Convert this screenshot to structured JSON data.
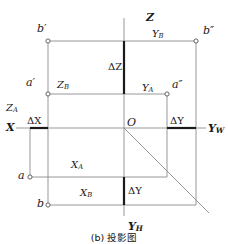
{
  "figure": {
    "caption": "(b) 投影图",
    "background_color": "#ffffff",
    "line_color": "#8c8c8c",
    "bold_line_color": "#1a1a1a",
    "text_color": "#1a1a1a"
  },
  "axes": [
    {
      "name": "z-axis",
      "label": "Z",
      "sub": "",
      "x": 146,
      "y": 12
    },
    {
      "name": "x-axis",
      "label": "X",
      "sub": "",
      "x": 6,
      "y": 122
    },
    {
      "name": "yw-axis",
      "label": "Y",
      "sub": "W",
      "x": 208,
      "y": 123
    },
    {
      "name": "yh-axis",
      "label": "Y",
      "sub": "H",
      "x": 128,
      "y": 221
    }
  ],
  "points": [
    {
      "name": "point-b-prime",
      "label": "b′",
      "lx": 37,
      "ly": 23,
      "cx": 48,
      "cy": 41
    },
    {
      "name": "point-b-double-prime",
      "label": "b″",
      "lx": 203,
      "ly": 25,
      "cx": 196,
      "cy": 41
    },
    {
      "name": "point-a-prime",
      "label": "a′",
      "lx": 26,
      "ly": 77,
      "cx": 48,
      "cy": 94
    },
    {
      "name": "point-a-double-prime",
      "label": "a″",
      "lx": 172,
      "ly": 79,
      "cx": 167,
      "cy": 94
    },
    {
      "name": "point-origin",
      "label": "O",
      "lx": 127,
      "ly": 117,
      "cx": 124,
      "cy": 128
    },
    {
      "name": "point-a",
      "label": "a",
      "lx": 18,
      "ly": 170,
      "cx": 30,
      "cy": 177
    },
    {
      "name": "point-b",
      "label": "b",
      "lx": 37,
      "ly": 198,
      "cx": 48,
      "cy": 205
    }
  ],
  "dimension_labels": [
    {
      "name": "label-yb",
      "text": "Y",
      "sub": "B",
      "x": 152,
      "y": 29,
      "size": 10
    },
    {
      "name": "label-zb",
      "text": "Z",
      "sub": "B",
      "x": 57,
      "y": 80,
      "size": 10
    },
    {
      "name": "label-delta-z",
      "text": "ΔZ",
      "sub": "",
      "x": 108,
      "y": 62,
      "size": 10
    },
    {
      "name": "label-ya",
      "text": "Y",
      "sub": "A",
      "x": 142,
      "y": 83,
      "size": 10
    },
    {
      "name": "label-za",
      "text": "Z",
      "sub": "A",
      "x": 6,
      "y": 103,
      "size": 10
    },
    {
      "name": "label-delta-x",
      "text": "ΔX",
      "sub": "",
      "x": 27,
      "y": 116,
      "size": 10
    },
    {
      "name": "label-delta-y-right",
      "text": "ΔY",
      "sub": "",
      "x": 170,
      "y": 116,
      "size": 10
    },
    {
      "name": "label-xa",
      "text": "X",
      "sub": "A",
      "x": 71,
      "y": 160,
      "size": 10
    },
    {
      "name": "label-xb",
      "text": "X",
      "sub": "B",
      "x": 80,
      "y": 188,
      "size": 10
    },
    {
      "name": "label-delta-y-bottom",
      "text": "ΔY",
      "sub": "",
      "x": 128,
      "y": 186,
      "size": 10
    }
  ],
  "geometry": {
    "origin": {
      "x": 124,
      "y": 128
    },
    "z_top": {
      "x": 124,
      "y": 18
    },
    "yh_bottom": {
      "x": 124,
      "y": 216
    },
    "x_left": {
      "x": 16,
      "y": 128
    },
    "yw_right": {
      "x": 206,
      "y": 128
    },
    "rows": {
      "b_prime": 41,
      "a_prime": 94,
      "a_plan": 177,
      "b_plan": 205
    },
    "cols": {
      "ab_left": 48,
      "a_left": 30,
      "a_pp": 167,
      "b_pp": 196
    },
    "bisector_end": {
      "x": 209,
      "y": 213
    },
    "bold_segments": [
      {
        "name": "delta-z-on-z-axis",
        "x1": 124,
        "y1": 41,
        "x2": 124,
        "y2": 94
      },
      {
        "name": "delta-x-on-x-axis",
        "x1": 30,
        "y1": 128,
        "x2": 48,
        "y2": 128
      },
      {
        "name": "delta-y-on-yw-axis",
        "x1": 167,
        "y1": 128,
        "x2": 196,
        "y2": 128
      },
      {
        "name": "delta-y-on-yh-axis",
        "x1": 124,
        "y1": 177,
        "x2": 124,
        "y2": 205
      }
    ]
  }
}
